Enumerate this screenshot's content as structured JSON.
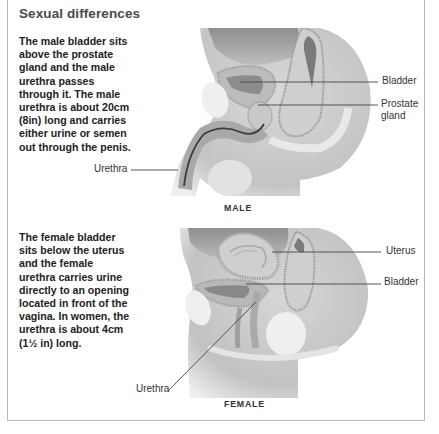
{
  "title": "Sexual differences",
  "male": {
    "description": "The male bladder sits above the prostate gland and the male urethra passes through it. The male urethra is about 20cm (8in) long and carries either urine or semen out through the penis.",
    "labels": {
      "bladder": "Bladder",
      "prostate": "Prostate gland",
      "urethra": "Urethra"
    },
    "caption": "MALE"
  },
  "female": {
    "description": "The female bladder sits below the uterus and the female urethra carries urine directly to an opening located in front of the vagina. In women, the urethra is about 4cm (1½ in) long.",
    "labels": {
      "uterus": "Uterus",
      "bladder": "Bladder",
      "urethra": "Urethra"
    },
    "caption": "FEMALE"
  },
  "colors": {
    "border": "#b9b9b9",
    "title": "#4a4a4a",
    "text": "#222222",
    "leader_line": "#444444"
  }
}
